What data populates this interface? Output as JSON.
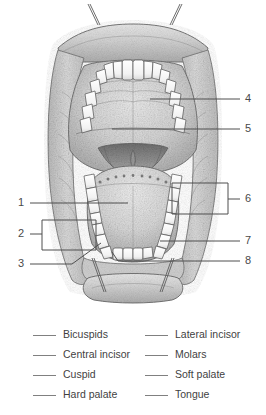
{
  "figure": {
    "callouts": [
      {
        "number": "1",
        "side": "left",
        "marker": "line",
        "target": "tongue"
      },
      {
        "number": "2",
        "side": "left",
        "marker": "bracket",
        "target": "lower-left-posterior-teeth"
      },
      {
        "number": "3",
        "side": "left",
        "marker": "line",
        "target": "lower-left-cuspid"
      },
      {
        "number": "4",
        "side": "right",
        "marker": "line",
        "target": "hard-palate"
      },
      {
        "number": "5",
        "side": "right",
        "marker": "line",
        "target": "soft-palate"
      },
      {
        "number": "6",
        "side": "right",
        "marker": "bracket",
        "target": "lower-right-posterior-teeth"
      },
      {
        "number": "7",
        "side": "right",
        "marker": "line",
        "target": "lower-right-cuspid"
      },
      {
        "number": "8",
        "side": "right",
        "marker": "line",
        "target": "lower-incisors"
      }
    ],
    "colors": {
      "ink": "#4a4a4a",
      "line": "#555555",
      "tissue_light": "#dcdcdc",
      "tissue_mid": "#bdbdbd",
      "tissue_dark": "#8f8f8f",
      "tooth": "#fafafa",
      "background": "#ffffff"
    }
  },
  "answer_key": {
    "blank_mark": "____",
    "left_column": [
      {
        "label": "Bicuspids"
      },
      {
        "label": "Central incisor"
      },
      {
        "label": "Cuspid"
      },
      {
        "label": "Hard palate"
      }
    ],
    "right_column": [
      {
        "label": "Lateral incisor"
      },
      {
        "label": "Molars"
      },
      {
        "label": "Soft palate"
      },
      {
        "label": "Tongue"
      }
    ]
  }
}
